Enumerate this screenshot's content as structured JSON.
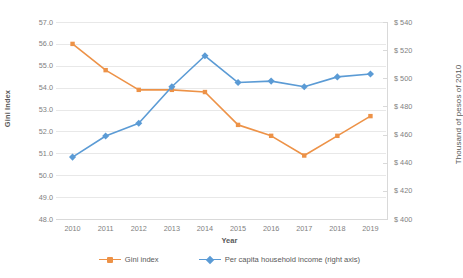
{
  "chart_data": {
    "type": "line",
    "title": "",
    "xlabel": "Year",
    "ylabel": "Gini Index",
    "y2label": "Thousand of pesos of 2010",
    "categories": [
      "2010",
      "2011",
      "2012",
      "2013",
      "2014",
      "2015",
      "2016",
      "2017",
      "2018",
      "2019"
    ],
    "ylim": [
      48.0,
      57.0
    ],
    "ytick_step": 1.0,
    "y2lim": [
      400,
      540
    ],
    "y2tick_step": 20,
    "grid": true,
    "legend_position": "bottom",
    "series": [
      {
        "name": "Gini index",
        "axis": "left",
        "color": "#ED9247",
        "marker": "square",
        "values": [
          56.0,
          54.8,
          53.9,
          53.9,
          53.8,
          52.3,
          51.8,
          50.9,
          51.8,
          52.7
        ]
      },
      {
        "name": "Per capita household income (right axis)",
        "axis": "right",
        "color": "#5B9BD5",
        "marker": "diamond",
        "values": [
          444,
          459,
          468,
          494,
          516,
          497,
          498,
          494,
          501,
          503
        ]
      }
    ],
    "yticks": [
      "48.0",
      "49.0",
      "50.0",
      "51.0",
      "52.0",
      "53.0",
      "54.0",
      "55.0",
      "56.0",
      "57.0"
    ],
    "y2ticks": [
      "$ 400",
      "$ 420",
      "$ 440",
      "$ 460",
      "$ 480",
      "$ 500",
      "$ 520",
      "$ 540"
    ],
    "colors": {
      "gini": "#ED9247",
      "income": "#5B9BD5",
      "grid": "#e8e8e8",
      "axis": "#d9d9d9",
      "text": "#595959",
      "tick_text": "#7f7f7f"
    }
  }
}
